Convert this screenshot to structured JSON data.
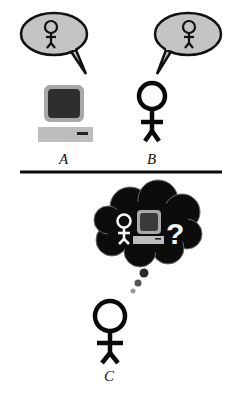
{
  "diagram": {
    "top_scene": {
      "agent_a": {
        "label": "A",
        "kind": "computer",
        "speech_bubble_content": "person-icon"
      },
      "agent_b": {
        "label": "B",
        "kind": "person",
        "speech_bubble_content": "person-icon"
      }
    },
    "bottom_scene": {
      "observer": {
        "label": "C",
        "kind": "person",
        "thought_bubble_content": [
          "person-icon",
          "computer-icon",
          "?"
        ]
      }
    },
    "question_mark": "?"
  },
  "colors": {
    "bubble_fill": "#c4c4c4",
    "outline": "#111111",
    "screen": "#2e2e2e",
    "monitor_frame": "#a8a8a8",
    "keyboard": "#bdbdbd",
    "cloud": "#0c0c0c"
  }
}
